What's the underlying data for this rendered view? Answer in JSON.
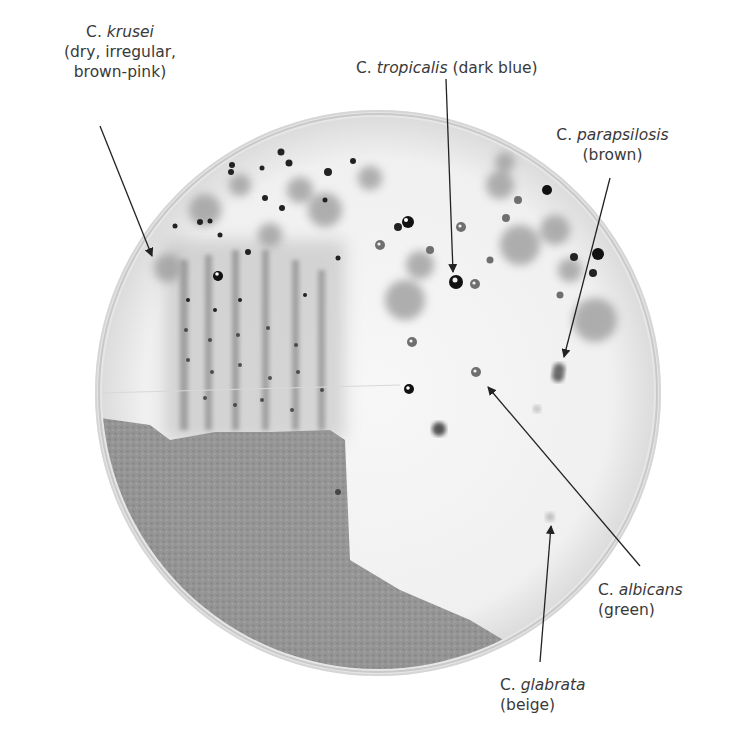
{
  "figure": {
    "plate": {
      "cx": 378,
      "cy": 393,
      "r": 283
    },
    "labels": [
      {
        "id": "krusei",
        "genus": "C.",
        "species": "krusei",
        "description_lines": [
          "(dry, irregular,",
          "brown-pink)"
        ],
        "pos": {
          "x": 96,
          "y": 18
        }
      },
      {
        "id": "tropicalis",
        "genus": "C.",
        "species": "tropicalis",
        "description_inline": "(dark blue)",
        "pos": {
          "x": 366,
          "y": 30
        }
      },
      {
        "id": "parapsilosis",
        "genus": "C.",
        "species": "parapsilosis",
        "description_lines": [
          "(brown)"
        ],
        "pos": {
          "x": 553,
          "y": 105
        }
      },
      {
        "id": "albicans",
        "genus": "C.",
        "species": "albicans",
        "description_lines": [
          "(green)"
        ],
        "pos": {
          "x": 596,
          "y": 577
        }
      },
      {
        "id": "glabrata",
        "genus": "C.",
        "species": "glabrata",
        "description_lines": [
          "(beige)"
        ],
        "pos": {
          "x": 496,
          "y": 672
        }
      }
    ]
  }
}
